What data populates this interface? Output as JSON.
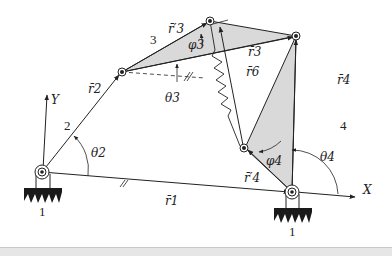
{
  "figure": {
    "labels": {
      "Y": "Y",
      "X": "X",
      "link1_left": "1",
      "link1_right": "1",
      "link2": "2",
      "link3": "3",
      "link4": "4",
      "r1": "r̄1",
      "r2": "r̄2",
      "r3": "r̄3",
      "r3p": "r̄′3",
      "r4": "r̄4",
      "r4p": "r̄′4",
      "r6": "r̄6",
      "theta2": "θ2",
      "theta3": "θ3",
      "theta4": "θ4",
      "phi3": "φ3",
      "phi4": "φ4"
    },
    "colors": {
      "line": "#222222",
      "fill": "#d9d9d9",
      "ground": "#1a1a1a"
    }
  }
}
